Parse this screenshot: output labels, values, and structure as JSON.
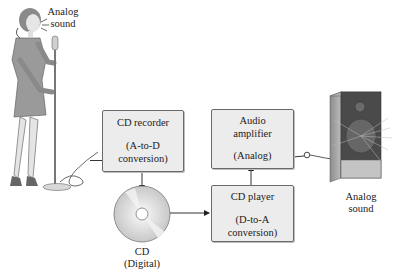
{
  "labels": {
    "singer_sound": [
      "Analog",
      "sound"
    ],
    "speaker_sound": [
      "Analog",
      "sound"
    ],
    "cd": [
      "CD",
      "(Digital)"
    ]
  },
  "boxes": {
    "cd_recorder": {
      "title": "CD recorder",
      "detail": [
        "(A-to-D",
        "conversion)"
      ]
    },
    "audio_amplifier": {
      "title": [
        "Audio",
        "amplifier"
      ],
      "detail": "(Analog)"
    },
    "cd_player": {
      "title": "CD player",
      "detail": [
        "(D-to-A",
        "conversion)"
      ]
    }
  },
  "colors": {
    "box_fill": "#ececec",
    "box_border": "#6a6a6a",
    "line": "#333333"
  }
}
